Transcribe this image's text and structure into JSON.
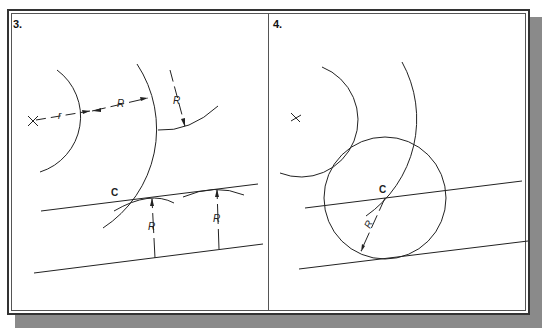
{
  "figure": {
    "panels": [
      {
        "number": "3.",
        "center_mark": "X",
        "point_label": "C",
        "dimension_labels": [
          "r",
          "R",
          "R",
          "R",
          "R"
        ]
      },
      {
        "number": "4.",
        "center_mark": "X",
        "point_label": "C",
        "dimension_labels": [
          "R"
        ]
      }
    ],
    "colors": {
      "line": "#222222",
      "frame": "#333333",
      "shadow": "#8a8a8a",
      "background": "#ffffff"
    }
  }
}
